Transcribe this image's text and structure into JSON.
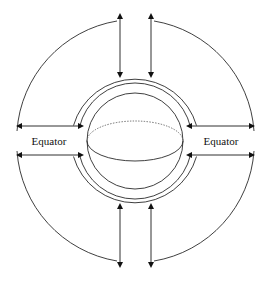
{
  "figure": {
    "type": "schematic-diagram",
    "width": 271,
    "height": 281,
    "background_color": "#ffffff",
    "stroke_color": "#2a2a2a"
  },
  "labels": {
    "left_equator": "Equator",
    "right_equator": "Equator"
  },
  "sphere": {
    "center_x": 135,
    "center_y": 141,
    "radius": 48,
    "equator_ellipse_rx": 48,
    "equator_ellipse_ry": 20,
    "equator_back_style": "dotted",
    "equator_front_style": "solid"
  },
  "rings": {
    "inner_ring_radius": 57,
    "middle_ring_radius": 64,
    "outer_arc_radius": 120,
    "equator_gap_degrees": 14
  },
  "arrows": {
    "horizontal": [
      {
        "name": "left-upper",
        "x1": 78,
        "y1": 126,
        "x2": 20,
        "y2": 126,
        "direction": "left",
        "double_headed": true
      },
      {
        "name": "left-lower",
        "x1": 78,
        "y1": 155,
        "x2": 20,
        "y2": 155,
        "direction": "left",
        "double_headed": true
      },
      {
        "name": "right-upper",
        "x1": 192,
        "y1": 126,
        "x2": 251,
        "y2": 126,
        "direction": "right",
        "double_headed": true
      },
      {
        "name": "right-lower",
        "x1": 192,
        "y1": 155,
        "x2": 251,
        "y2": 155,
        "direction": "right",
        "double_headed": true
      }
    ],
    "vertical": [
      {
        "name": "top-left",
        "x1": 120,
        "y1": 72,
        "x2": 120,
        "y2": 17,
        "direction": "up",
        "double_headed": true
      },
      {
        "name": "top-right",
        "x1": 151,
        "y1": 72,
        "x2": 151,
        "y2": 17,
        "direction": "up",
        "double_headed": true
      },
      {
        "name": "bottom-left",
        "x1": 120,
        "y1": 209,
        "x2": 120,
        "y2": 264,
        "direction": "down",
        "double_headed": true
      },
      {
        "name": "bottom-right",
        "x1": 151,
        "y1": 209,
        "x2": 151,
        "y2": 264,
        "direction": "down",
        "double_headed": true
      }
    ],
    "count_radial": 8
  }
}
